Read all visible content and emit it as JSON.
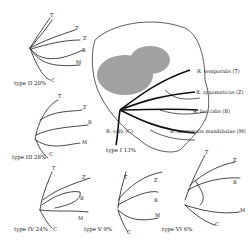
{
  "figure": {
    "center_labels": [
      {
        "text": "R. temporalis (T)"
      },
      {
        "text": "R. zygomaticus (Z)"
      },
      {
        "text": "R. buccalis (B)"
      },
      {
        "text": "R. marginalis mandibulae (M)"
      },
      {
        "text": "R. colli (C)"
      }
    ],
    "panels": [
      {
        "id": "type1",
        "caption": "type I 13%"
      },
      {
        "id": "type2",
        "caption": "type II 20%",
        "branch_letters": [
          "T",
          "Z",
          "Z",
          "B",
          "M",
          "C"
        ]
      },
      {
        "id": "type3",
        "caption": "type III 28%",
        "branch_letters": [
          "T",
          "Z",
          "B",
          "M",
          "C"
        ]
      },
      {
        "id": "type4",
        "caption": "type IV 24%",
        "branch_letters": [
          "T",
          "Z",
          "B",
          "M",
          "C"
        ]
      },
      {
        "id": "type5",
        "caption": "type V 9%",
        "branch_letters": [
          "T",
          "Z",
          "B",
          "M",
          "C"
        ]
      },
      {
        "id": "type6",
        "caption": "type VI 6%",
        "branch_letters": [
          "T",
          "Z",
          "B",
          "M",
          "C"
        ]
      }
    ]
  },
  "colors": {
    "ink": "#222222",
    "background": "#ffffff",
    "shade": "#555555"
  }
}
